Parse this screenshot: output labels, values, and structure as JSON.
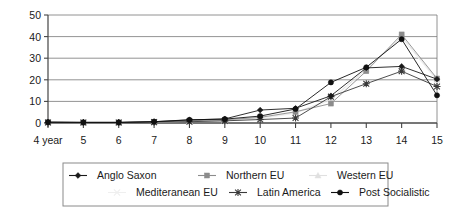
{
  "chart_data": {
    "type": "line",
    "title": "",
    "xlabel": "",
    "ylabel": "",
    "ylim": [
      0,
      50
    ],
    "yticks": [
      0,
      10,
      20,
      30,
      40,
      50
    ],
    "grid": true,
    "legend_position": "bottom",
    "categories": [
      "4 year",
      "5",
      "6",
      "7",
      "8",
      "9",
      "10",
      "11",
      "12",
      "13",
      "14",
      "15"
    ],
    "x_values": [
      4,
      5,
      6,
      7,
      8,
      9,
      10,
      11,
      12,
      13,
      14,
      15
    ],
    "series": [
      {
        "name": "Anglo Saxon",
        "marker": "diamond",
        "color": "#1a1a1a",
        "values": [
          0.4,
          0.3,
          0.3,
          0.6,
          1.4,
          1.9,
          6.0,
          6.8,
          12.6,
          25.5,
          26.2,
          20.3
        ]
      },
      {
        "name": "Northern EU",
        "marker": "square",
        "color": "#8c8c8c",
        "values": [
          0.3,
          0.2,
          0.2,
          0.5,
          1.0,
          1.5,
          2.6,
          5.2,
          9.0,
          24.0,
          41.0,
          20.6
        ]
      },
      {
        "name": "Western EU",
        "marker": "triangle",
        "color": "#e0e0e0",
        "values": [
          0.2,
          0.2,
          0.2,
          0.4,
          0.8,
          1.2,
          2.2,
          4.8,
          11.0,
          25.0,
          40.0,
          20.0
        ]
      },
      {
        "name": "Mediteranean EU",
        "marker": "cross",
        "color": "#efefef",
        "values": [
          0.2,
          0.2,
          0.2,
          0.4,
          0.7,
          1.0,
          2.0,
          4.5,
          10.5,
          24.5,
          39.5,
          19.5
        ]
      },
      {
        "name": "Latin America",
        "marker": "star",
        "color": "#3a3a3a",
        "values": [
          0.2,
          0.2,
          0.2,
          0.4,
          0.6,
          1.0,
          1.6,
          2.3,
          12.2,
          18.2,
          24.0,
          16.9
        ]
      },
      {
        "name": "Post Socialistic",
        "marker": "circle",
        "color": "#111111",
        "values": [
          0.4,
          0.3,
          0.3,
          0.6,
          1.5,
          1.8,
          3.2,
          6.5,
          18.8,
          25.8,
          38.8,
          12.8
        ]
      }
    ]
  },
  "legend": {
    "items": [
      {
        "label": "Anglo Saxon"
      },
      {
        "label": "Northern EU"
      },
      {
        "label": "Western EU"
      },
      {
        "label": "Mediteranean EU"
      },
      {
        "label": "Latin America"
      },
      {
        "label": "Post Socialistic"
      }
    ]
  }
}
